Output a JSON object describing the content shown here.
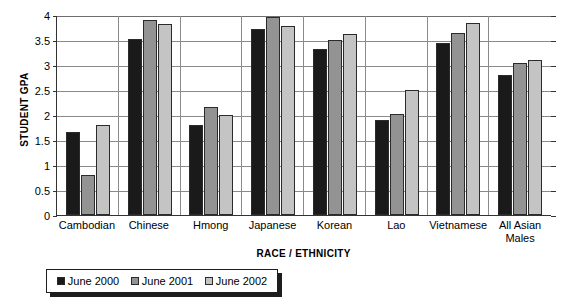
{
  "chart_data": {
    "type": "bar",
    "title": "",
    "xlabel": "RACE / ETHNICITY",
    "ylabel": "STUDENT GPA",
    "ylim": [
      0,
      4
    ],
    "ytick_labels": [
      "4",
      "3.5",
      "3",
      "2.5",
      "2",
      "1.5",
      "1",
      "0.5",
      "0"
    ],
    "ytick_values": [
      4,
      3.5,
      3,
      2.5,
      2,
      1.5,
      1,
      0.5,
      0
    ],
    "grid": "horizontal",
    "legend_position": "bottom",
    "categories": [
      "Cambodian",
      "Chinese",
      "Hmong",
      "Japanese",
      "Korean",
      "Lao",
      "Vietnamese",
      "All Asian Males"
    ],
    "category_lines": [
      [
        "Cambodian"
      ],
      [
        "Chinese"
      ],
      [
        "Hmong"
      ],
      [
        "Japanese"
      ],
      [
        "Korean"
      ],
      [
        "Lao"
      ],
      [
        "Vietnamese"
      ],
      [
        "All Asian",
        "Males"
      ]
    ],
    "series": [
      {
        "name": "June 2000",
        "color": "#1a1a1a",
        "values": [
          1.67,
          3.52,
          1.8,
          3.72,
          3.33,
          1.9,
          3.44,
          2.8
        ]
      },
      {
        "name": "June 2001",
        "color": "#939393",
        "values": [
          0.8,
          3.9,
          2.17,
          3.96,
          3.5,
          2.02,
          3.65,
          3.05
        ]
      },
      {
        "name": "June 2002",
        "color": "#c4c4c4",
        "values": [
          1.8,
          3.82,
          2.01,
          3.78,
          3.62,
          2.5,
          3.85,
          3.1
        ]
      }
    ]
  },
  "legend": {
    "items": [
      {
        "label": "June 2000",
        "swatch": "s0"
      },
      {
        "label": "June 2001",
        "swatch": "s1"
      },
      {
        "label": "June 2002",
        "swatch": "s2"
      }
    ]
  }
}
